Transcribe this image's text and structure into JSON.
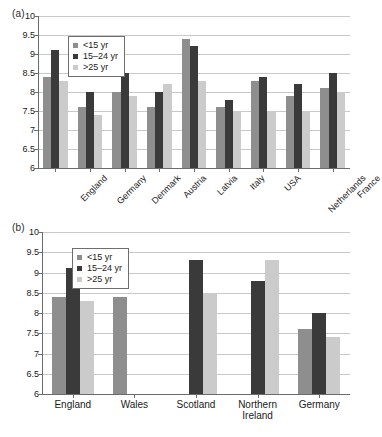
{
  "figure": {
    "panel_a_label": "(a)",
    "panel_b_label": "(b)"
  },
  "legend": {
    "items": [
      {
        "label": "<15 yr",
        "color": "#8e8e8e"
      },
      {
        "label": "15–24 yr",
        "color": "#3a3a3a"
      },
      {
        "label": ">25 yr",
        "color": "#cbcbcb"
      }
    ]
  },
  "chart_data": [
    {
      "type": "bar",
      "panel": "(a)",
      "title": "",
      "xlabel": "",
      "ylabel": "",
      "ylim": [
        6,
        10
      ],
      "ytick_labels": [
        "6",
        "6.5",
        "7",
        "7.5",
        "8",
        "8.5",
        "9",
        "9.5",
        "10"
      ],
      "yticks": [
        6,
        6.5,
        7,
        7.5,
        8,
        8.5,
        9,
        9.5,
        10
      ],
      "grid": true,
      "legend_position": "upper-left",
      "categories": [
        "England",
        "Germany",
        "Denmark",
        "Austria",
        "Latvia",
        "Italy",
        "USA",
        "Netherlands",
        "France"
      ],
      "series": [
        {
          "name": "<15 yr",
          "color": "#8e8e8e",
          "values": [
            8.4,
            7.6,
            8.0,
            7.6,
            9.4,
            7.6,
            8.3,
            7.9,
            8.1
          ]
        },
        {
          "name": "15–24 yr",
          "color": "#3a3a3a",
          "values": [
            9.1,
            8.0,
            8.5,
            8.0,
            9.2,
            7.8,
            8.4,
            8.2,
            8.5
          ]
        },
        {
          "name": ">25 yr",
          "color": "#cbcbcb",
          "values": [
            8.3,
            7.4,
            7.9,
            8.2,
            8.3,
            7.5,
            7.5,
            7.5,
            8.0
          ]
        }
      ]
    },
    {
      "type": "bar",
      "panel": "(b)",
      "title": "",
      "xlabel": "",
      "ylabel": "",
      "ylim": [
        6,
        10
      ],
      "ytick_labels": [
        "6",
        "6.5",
        "7",
        "7.5",
        "8",
        "8.5",
        "9",
        "9.5",
        "10"
      ],
      "yticks": [
        6,
        6.5,
        7,
        7.5,
        8,
        8.5,
        9,
        9.5,
        10
      ],
      "grid": true,
      "legend_position": "upper-left",
      "categories": [
        "England",
        "Wales",
        "Scotland",
        "Northern Ireland",
        "Germany"
      ],
      "category_lines": [
        [
          "England"
        ],
        [
          "Wales"
        ],
        [
          "Scotland"
        ],
        [
          "Northern",
          "Ireland"
        ],
        [
          "Germany"
        ]
      ],
      "series": [
        {
          "name": "<15 yr",
          "color": "#8e8e8e",
          "values": [
            8.4,
            8.4,
            null,
            null,
            7.6
          ]
        },
        {
          "name": "15–24 yr",
          "color": "#3a3a3a",
          "values": [
            9.1,
            null,
            9.3,
            8.8,
            8.0
          ]
        },
        {
          "name": ">25 yr",
          "color": "#cbcbcb",
          "values": [
            8.3,
            null,
            8.5,
            9.3,
            7.4
          ]
        }
      ]
    }
  ]
}
